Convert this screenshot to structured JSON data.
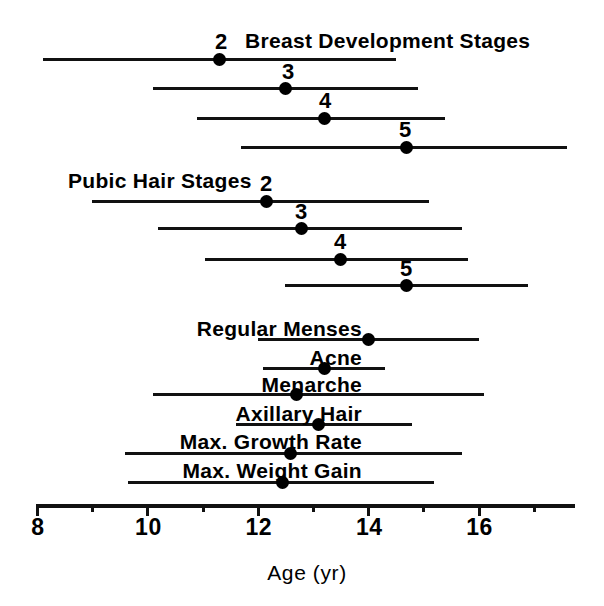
{
  "figure": {
    "background": "#ffffff",
    "ink_color": "#000000",
    "width": 604,
    "height": 606
  },
  "axis": {
    "title": "Age (yr)",
    "tick_labels": [
      "8",
      "10",
      "12",
      "14",
      "16"
    ],
    "tick_values": [
      8,
      10,
      12,
      14,
      16
    ],
    "minor_tick_values": [
      9,
      11,
      13,
      15,
      17
    ],
    "range_min": 8,
    "range_max": 17.6,
    "pixel_origin_x": 37,
    "pixel_per_year": 55.2,
    "line_y": 504
  },
  "groups": [
    {
      "id": "breast",
      "title": "Breast Development Stages",
      "title_x": 245,
      "title_y": 30
    },
    {
      "id": "pubic",
      "title": "Pubic Hair Stages",
      "title_x": 68,
      "title_y": 170
    }
  ],
  "chart_data": {
    "type": "range_dot_plot",
    "title": "",
    "xlabel": "Age (yr)",
    "ylabel": "",
    "xlim": [
      8,
      17.6
    ],
    "grid": false,
    "legend": "none",
    "series": [
      {
        "group": "Breast Development Stages",
        "label": "2",
        "label_position": "above-dot",
        "range_start": 8.1,
        "range_end": 14.5,
        "mean": 11.3,
        "y": 58,
        "label_x": 221,
        "label_y": 31
      },
      {
        "group": "Breast Development Stages",
        "label": "3",
        "label_position": "above-dot",
        "range_start": 10.1,
        "range_end": 14.9,
        "mean": 12.5,
        "y": 87,
        "label_x": 288,
        "label_y": 61
      },
      {
        "group": "Breast Development Stages",
        "label": "4",
        "label_position": "above-dot",
        "range_start": 10.9,
        "range_end": 15.4,
        "mean": 13.2,
        "y": 117,
        "label_x": 325,
        "label_y": 90
      },
      {
        "group": "Breast Development Stages",
        "label": "5",
        "label_position": "above-dot",
        "range_start": 11.7,
        "range_end": 17.6,
        "mean": 14.7,
        "y": 146,
        "label_x": 405,
        "label_y": 119
      },
      {
        "group": "Pubic Hair Stages",
        "label": "2",
        "label_position": "above-dot",
        "range_start": 9.0,
        "range_end": 15.1,
        "mean": 12.15,
        "y": 200,
        "label_x": 266,
        "label_y": 173
      },
      {
        "group": "Pubic Hair Stages",
        "label": "3",
        "label_position": "above-dot",
        "range_start": 10.2,
        "range_end": 15.7,
        "mean": 12.8,
        "y": 227,
        "label_x": 301,
        "label_y": 201
      },
      {
        "group": "Pubic Hair Stages",
        "label": "4",
        "label_position": "above-dot",
        "range_start": 11.05,
        "range_end": 15.8,
        "mean": 13.5,
        "y": 258,
        "label_x": 340,
        "label_y": 231
      },
      {
        "group": "Pubic Hair Stages",
        "label": "5",
        "label_position": "above-dot",
        "range_start": 12.5,
        "range_end": 16.9,
        "mean": 14.7,
        "y": 284,
        "label_x": 406,
        "label_y": 258
      },
      {
        "group": "Events",
        "label": "Regular Menses",
        "label_position": "left",
        "range_start": 12.0,
        "range_end": 16.0,
        "mean": 14.0,
        "y": 338,
        "label_x": 362,
        "label_y": 318
      },
      {
        "group": "Events",
        "label": "Acne",
        "label_position": "left",
        "range_start": 12.1,
        "range_end": 14.3,
        "mean": 13.2,
        "y": 367,
        "label_x": 362,
        "label_y": 347
      },
      {
        "group": "Events",
        "label": "Menarche",
        "label_position": "left",
        "range_start": 10.1,
        "range_end": 16.1,
        "mean": 12.7,
        "y": 393,
        "label_x": 362,
        "label_y": 374
      },
      {
        "group": "Events",
        "label": "Axillary Hair",
        "label_position": "left",
        "range_start": 11.6,
        "range_end": 14.8,
        "mean": 13.1,
        "y": 423,
        "label_x": 362,
        "label_y": 403
      },
      {
        "group": "Events",
        "label": "Max. Growth Rate",
        "label_position": "left",
        "range_start": 9.6,
        "range_end": 15.7,
        "mean": 12.6,
        "y": 452,
        "label_x": 362,
        "label_y": 431
      },
      {
        "group": "Events",
        "label": "Max. Weight Gain",
        "label_position": "left",
        "range_start": 9.65,
        "range_end": 15.2,
        "mean": 12.45,
        "y": 481,
        "label_x": 362,
        "label_y": 460
      }
    ]
  }
}
